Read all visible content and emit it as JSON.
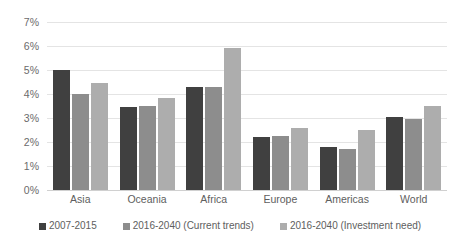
{
  "chart_data": {
    "type": "bar",
    "title": "",
    "subtitle": "",
    "xlabel": "",
    "ylabel": "",
    "categories": [
      "Asia",
      "Oceania",
      "Africa",
      "Europe",
      "Americas",
      "World"
    ],
    "series": [
      {
        "name": "2007-2015",
        "color": "#404040",
        "values": [
          5.0,
          3.47,
          4.3,
          2.2,
          1.78,
          3.05
        ]
      },
      {
        "name": "2016-2040 (Current trends)",
        "color": "#8d8d8d",
        "values": [
          4.0,
          3.5,
          4.3,
          2.25,
          1.72,
          2.95
        ]
      },
      {
        "name": "2016-2040 (Investment need)",
        "color": "#adadad",
        "values": [
          4.45,
          3.82,
          5.9,
          2.6,
          2.52,
          3.5
        ]
      }
    ],
    "ylim": [
      0,
      7
    ],
    "y_ticks": [
      7,
      6,
      5,
      4,
      3,
      2,
      1,
      0
    ],
    "y_tick_labels": [
      "7%",
      "6%",
      "5%",
      "4%",
      "3%",
      "2%",
      "1%",
      "0%"
    ],
    "y_tick_suffix": "%",
    "grid": true,
    "grid_color": "#e4e4e4",
    "legend_position": "bottom",
    "legend": [
      "2007-2015",
      "2016-2040 (Current trends)",
      "2016-2040 (Investment need)"
    ]
  }
}
